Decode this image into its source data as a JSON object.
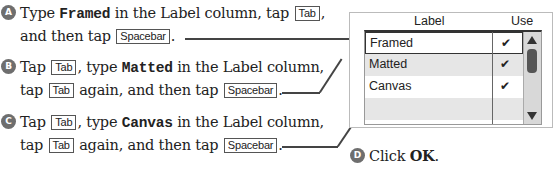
{
  "steps": [
    {
      "badge": "A",
      "line1": {
        "pre": "Type ",
        "code": "Framed",
        "post": " in the Label column, tap ",
        "key": "Tab",
        "end": ","
      },
      "line2": {
        "pre": "and then tap ",
        "key": "Spacebar",
        "end": "."
      }
    },
    {
      "badge": "B",
      "line1": {
        "pre": "Tap ",
        "key": "Tab",
        "mid": ", type ",
        "code": "Matted",
        "post": " in the Label column,"
      },
      "line2": {
        "pre": "tap ",
        "key": "Tab",
        "mid": " again, and then tap ",
        "key2": "Spacebar",
        "end": "."
      }
    },
    {
      "badge": "C",
      "line1": {
        "pre": "Tap ",
        "key": "Tab",
        "mid": ", type ",
        "code": "Canvas",
        "post": " in the Label column,"
      },
      "line2": {
        "pre": "tap ",
        "key": "Tab",
        "mid": " again, and then tap ",
        "key2": "Spacebar",
        "end": "."
      }
    },
    {
      "badge": "D",
      "text": "Click ",
      "bold": "OK",
      "end": "."
    }
  ],
  "dialog": {
    "columns": {
      "label": "Label",
      "use": "Use"
    },
    "rows": [
      {
        "label": "Framed",
        "use": "✔"
      },
      {
        "label": "Matted",
        "use": "✔"
      },
      {
        "label": "Canvas",
        "use": "✔"
      },
      {
        "label": "",
        "use": ""
      }
    ]
  }
}
